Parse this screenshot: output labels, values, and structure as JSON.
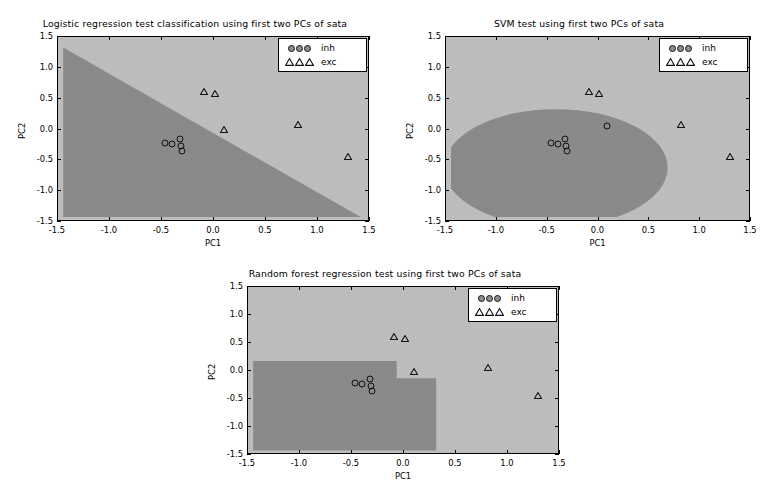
{
  "figure": {
    "width": 769,
    "height": 495,
    "background": "#ffffff",
    "region_color_class0": "#8a8a8a",
    "region_color_class1": "#bfbfbf",
    "marker_edge_color": "#111111"
  },
  "legend": {
    "entries": [
      {
        "label": "inh",
        "marker": "circle-marker",
        "count": 3
      },
      {
        "label": "exc",
        "marker": "triangle-marker",
        "count": 3
      }
    ]
  },
  "axis": {
    "xlabel": "PC1",
    "ylabel": "PC2",
    "xticks": [
      "-1.5",
      "-1.0",
      "-0.5",
      "0.0",
      "0.5",
      "1.0",
      "1.5"
    ],
    "yticks": [
      "1.5",
      "1.0",
      "0.5",
      "0.0",
      "-0.5",
      "-1.0",
      "-1.5"
    ],
    "xlim": [
      -1.5,
      1.5
    ],
    "ylim": [
      -1.5,
      1.5
    ],
    "grid": false
  },
  "chart_data": [
    {
      "type": "scatter",
      "id": "logistic-regression",
      "title": "Logistic regression test classification using first two PCs of sata",
      "xlabel": "PC1",
      "ylabel": "PC2",
      "xlim": [
        -1.5,
        1.5
      ],
      "ylim": [
        -1.5,
        1.5
      ],
      "xticks": [
        -1.5,
        -1.0,
        -0.5,
        0.0,
        0.5,
        1.0,
        1.5
      ],
      "yticks": [
        -1.5,
        -1.0,
        -0.5,
        0.0,
        0.5,
        1.0,
        1.5
      ],
      "grid": false,
      "legend_position": "upper right",
      "decision_boundary": {
        "kind": "linear",
        "description": "diagonal line from upper-left to lower-right; dark region below-left, light region above-right",
        "line_points": [
          [
            -1.45,
            1.33
          ],
          [
            1.41,
            -1.42
          ]
        ]
      },
      "regions": [
        {
          "name": "inh",
          "color": "#8a8a8a",
          "side": "lower-left"
        },
        {
          "name": "exc",
          "color": "#bfbfbf",
          "side": "upper-right"
        }
      ],
      "series": [
        {
          "name": "inh",
          "marker": "circle",
          "points": [
            [
              -0.47,
              -0.22
            ],
            [
              -0.4,
              -0.23
            ],
            [
              -0.33,
              -0.15
            ],
            [
              -0.32,
              -0.26
            ],
            [
              -0.31,
              -0.35
            ]
          ]
        },
        {
          "name": "exc",
          "marker": "triangle",
          "points": [
            [
              -0.13,
              0.67
            ],
            [
              -0.03,
              0.64
            ],
            [
              0.06,
              0.05
            ],
            [
              0.77,
              0.13
            ],
            [
              1.25,
              -0.38
            ]
          ]
        }
      ]
    },
    {
      "type": "scatter",
      "id": "svm",
      "title": "SVM test using first two PCs of sata",
      "xlabel": "PC1",
      "ylabel": "PC2",
      "xlim": [
        -1.5,
        1.5
      ],
      "ylim": [
        -1.5,
        1.5
      ],
      "xticks": [
        -1.5,
        -1.0,
        -0.5,
        0.0,
        0.5,
        1.0,
        1.5
      ],
      "yticks": [
        -1.5,
        -1.0,
        -0.5,
        0.0,
        0.5,
        1.0,
        1.5
      ],
      "grid": false,
      "legend_position": "upper right",
      "decision_boundary": {
        "kind": "rbf-blob",
        "description": "large rounded dark region occupying the left and lower-centre, boundary arcs from left edge at y=0.18 over the top near y=0.33 and curves down through x=0.68 to the bottom edge",
        "blob_center": [
          -0.75,
          -0.95
        ],
        "blob_right_edge_x": 0.68,
        "blob_top_y": 0.33
      },
      "regions": [
        {
          "name": "inh",
          "color": "#8a8a8a",
          "side": "interior-blob"
        },
        {
          "name": "exc",
          "color": "#bfbfbf",
          "side": "exterior"
        }
      ],
      "series": [
        {
          "name": "inh",
          "marker": "circle",
          "points": [
            [
              -0.47,
              -0.22
            ],
            [
              -0.4,
              -0.23
            ],
            [
              -0.33,
              -0.15
            ],
            [
              -0.32,
              -0.26
            ],
            [
              -0.31,
              -0.35
            ],
            [
              0.08,
              0.06
            ]
          ]
        },
        {
          "name": "exc",
          "marker": "triangle",
          "points": [
            [
              -0.13,
              0.67
            ],
            [
              -0.03,
              0.64
            ],
            [
              0.77,
              0.13
            ],
            [
              1.25,
              -0.38
            ]
          ]
        }
      ]
    },
    {
      "type": "scatter",
      "id": "random-forest",
      "title": "Random forest regression test using first two PCs of sata",
      "xlabel": "PC1",
      "ylabel": "PC2",
      "xlim": [
        -1.5,
        1.5
      ],
      "ylim": [
        -1.5,
        1.5
      ],
      "xticks": [
        -1.5,
        -1.0,
        -0.5,
        0.0,
        0.5,
        1.0,
        1.5
      ],
      "yticks": [
        -1.5,
        -1.0,
        -0.5,
        0.0,
        0.5,
        1.0,
        1.5
      ],
      "grid": false,
      "legend_position": "upper right",
      "decision_boundary": {
        "kind": "axis-aligned-steps",
        "description": "dark rectangular block from left edge up to y=0.18 and right to x=-0.07, stepping down to y=-0.13 between x=-0.07 and x=0.31, then light beyond",
        "steps": [
          {
            "x_from": -1.45,
            "x_to": -0.07,
            "y_top": 0.18
          },
          {
            "x_from": -0.07,
            "x_to": 0.31,
            "y_top": -0.13
          }
        ]
      },
      "regions": [
        {
          "name": "inh",
          "color": "#8a8a8a",
          "side": "lower-left-block"
        },
        {
          "name": "exc",
          "color": "#bfbfbf",
          "side": "remainder"
        }
      ],
      "series": [
        {
          "name": "inh",
          "marker": "circle",
          "points": [
            [
              -0.47,
              -0.22
            ],
            [
              -0.4,
              -0.23
            ],
            [
              -0.33,
              -0.15
            ],
            [
              -0.32,
              -0.26
            ],
            [
              -0.31,
              -0.35
            ]
          ]
        },
        {
          "name": "exc",
          "marker": "triangle",
          "points": [
            [
              -0.13,
              0.67
            ],
            [
              -0.03,
              0.64
            ],
            [
              0.06,
              0.05
            ],
            [
              0.77,
              0.13
            ],
            [
              1.25,
              -0.38
            ]
          ]
        }
      ]
    }
  ]
}
